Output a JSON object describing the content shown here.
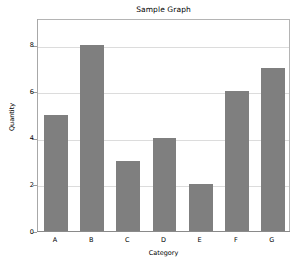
{
  "chart_data": {
    "type": "bar",
    "title": "Sample Graph",
    "xlabel": "Category",
    "ylabel": "Quantity",
    "categories": [
      "A",
      "B",
      "C",
      "D",
      "E",
      "F",
      "G"
    ],
    "values": [
      5,
      8,
      3,
      4,
      2,
      6,
      7
    ],
    "yticks": [
      0,
      2,
      4,
      6,
      8
    ],
    "ytick_labels": [
      "0",
      "2",
      "4",
      "6",
      "8"
    ],
    "ylim": [
      0,
      9.15
    ],
    "xlim_categories": 7,
    "grid": true,
    "grid_axis": "y",
    "legend": null,
    "bar_color": "#7f7f7f",
    "frame_color": "#b4b4b4",
    "grid_color": "#dcdcdc",
    "background": "#ffffff"
  }
}
